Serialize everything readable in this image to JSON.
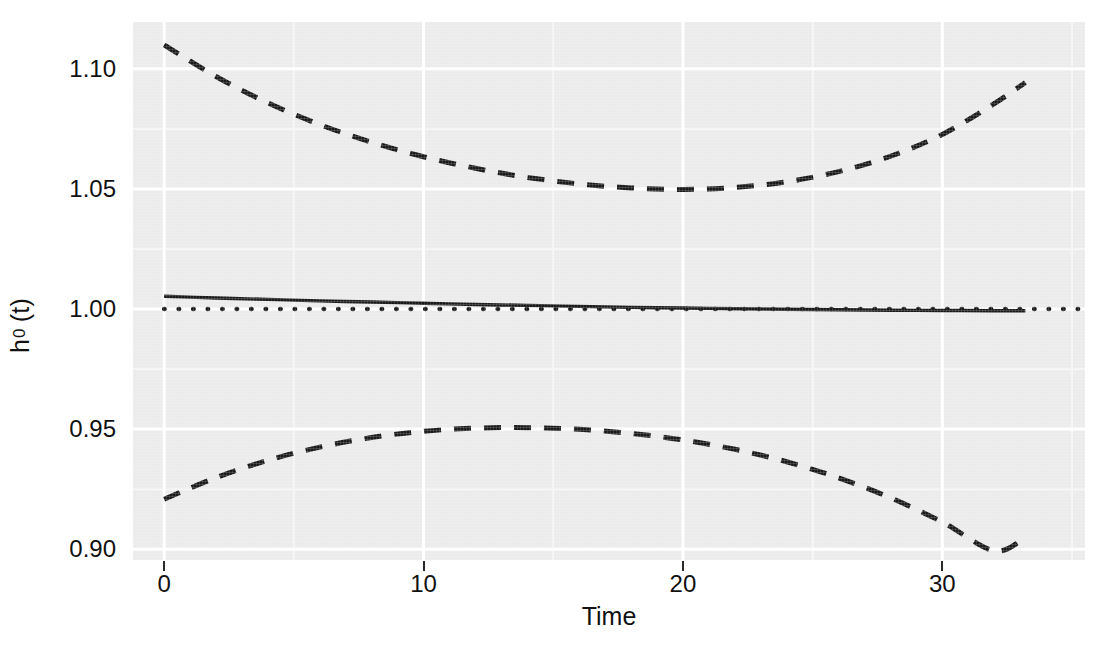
{
  "chart_data": {
    "type": "line",
    "title": "",
    "subtitle": "",
    "xlabel": "Time",
    "ylabel": "h0 (t)",
    "ylabel_base": "h",
    "ylabel_sub": "0",
    "ylabel_tail": "(t)",
    "xlim": [
      -1.2,
      35.5
    ],
    "ylim": [
      0.8955,
      1.1195
    ],
    "xticks": [
      0,
      10,
      20,
      30
    ],
    "xticklabels": [
      "0",
      "10",
      "20",
      "30"
    ],
    "yticks": [
      0.9,
      0.95,
      1.0,
      1.05,
      1.1
    ],
    "yticklabels": [
      "0.90",
      "0.95",
      "1.00",
      "1.05",
      "1.10"
    ],
    "grid": true,
    "grid_major_color": "#ffffff",
    "grid_minor_color": "#f5f5f5",
    "panel_fill": "#ebebeb",
    "legend": "none",
    "reference_line": {
      "name": "null reference h0 = 1",
      "y": 1.0,
      "style": "dotted",
      "color": "#1a1a1a",
      "x_start": 0,
      "x_end": 35.5
    },
    "series": [
      {
        "name": "estimate",
        "style": "solid",
        "color": "#1a1a1a",
        "x": [
          0,
          2,
          4,
          6,
          8,
          10,
          12,
          14,
          16,
          18,
          20,
          22,
          24,
          26,
          28,
          30,
          32,
          33.2
        ],
        "y": [
          1.0053,
          1.0046,
          1.004,
          1.0034,
          1.0029,
          1.0024,
          1.0019,
          1.0015,
          1.0011,
          1.0007,
          1.0004,
          1.0001,
          0.9999,
          0.9997,
          0.9995,
          0.9994,
          0.9993,
          0.9993
        ]
      },
      {
        "name": "upper confidence band",
        "style": "dashed",
        "color": "#1a1a1a",
        "x": [
          0,
          2,
          4,
          6,
          8,
          10,
          12,
          14,
          16,
          18,
          20,
          22,
          24,
          26,
          28,
          30,
          32,
          33.2
        ],
        "y": [
          1.11,
          1.0968,
          1.0858,
          1.0768,
          1.0694,
          1.0634,
          1.0586,
          1.0548,
          1.0521,
          1.0504,
          1.0498,
          1.0506,
          1.053,
          1.0572,
          1.0636,
          1.0727,
          1.0855,
          1.0943
        ]
      },
      {
        "name": "lower confidence band",
        "style": "dashed",
        "color": "#1a1a1a",
        "x": [
          0,
          2,
          4,
          6,
          8,
          10,
          12,
          14,
          16,
          18,
          20,
          22,
          24,
          26,
          28,
          30,
          32,
          33.2
        ],
        "y": [
          0.9208,
          0.9298,
          0.937,
          0.9425,
          0.9465,
          0.9491,
          0.9504,
          0.9506,
          0.9499,
          0.9482,
          0.9455,
          0.9416,
          0.9364,
          0.9297,
          0.9214,
          0.9113,
          0.8993,
          0.905
        ]
      }
    ]
  }
}
